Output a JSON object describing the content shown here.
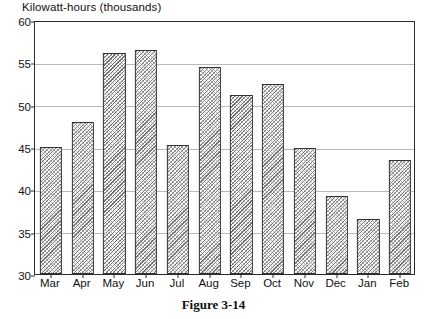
{
  "figure": {
    "caption": "Figure 3-14"
  },
  "chart_data": {
    "type": "bar",
    "title": "Kilowatt-hours (thousands)",
    "xlabel": "",
    "ylabel": "Kilowatt-hours (thousands)",
    "categories": [
      "Mar",
      "Apr",
      "May",
      "Jun",
      "Jul",
      "Aug",
      "Sep",
      "Oct",
      "Nov",
      "Dec",
      "Jan",
      "Feb"
    ],
    "values": [
      45.0,
      48.0,
      56.1,
      56.5,
      45.2,
      54.4,
      51.1,
      52.4,
      44.9,
      39.2,
      36.5,
      43.5
    ],
    "ylim": [
      30,
      60
    ],
    "yticks": [
      30,
      35,
      40,
      45,
      50,
      55,
      60
    ],
    "ytick_labels": [
      "30",
      "35",
      "40",
      "45",
      "50",
      "55",
      "60"
    ],
    "grid": true,
    "legend": false,
    "legend_position": "none",
    "bar_fill": "diagonal-hatch",
    "colors": {
      "axis": "#2b2b2b",
      "grid": "#b9b9b9",
      "bar_edge": "#333333",
      "bar_hatch": "#6f6f6f",
      "background": "#ffffff",
      "text": "#111111"
    }
  }
}
